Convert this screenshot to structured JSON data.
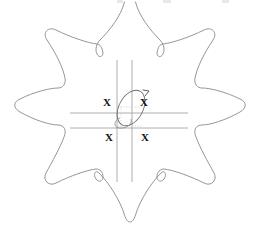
{
  "figure": {
    "background_color": "#ffffff",
    "outline_color": "#8a8a8a",
    "guide_line_color": "#9a9a9a",
    "marker_color": "#111111",
    "dotted_color": "#cccccc",
    "width": 253,
    "height": 235
  },
  "markers": {
    "label": "X",
    "positions": [
      {
        "name": "x-marker-top-left",
        "left": 103,
        "top": 97
      },
      {
        "name": "x-marker-top-right",
        "left": 140,
        "top": 97
      },
      {
        "name": "x-marker-bottom-left",
        "left": 105,
        "top": 132
      },
      {
        "name": "x-marker-bottom-right",
        "left": 141,
        "top": 132
      }
    ]
  },
  "guides": {
    "vertical_lines_x": [
      117,
      132
    ],
    "horizontal_lines_y": [
      113,
      128
    ],
    "vertical_span": [
      60,
      182
    ],
    "horizontal_span": [
      70,
      188
    ]
  },
  "center_shape": {
    "name": "tilted-ellipse",
    "cx": 131,
    "cy": 108,
    "rx": 12,
    "ry": 19,
    "rotation_deg": 28,
    "arrow": {
      "x": 148,
      "y": 92
    }
  },
  "petals": [
    {
      "name": "petal-top",
      "direction": "up"
    },
    {
      "name": "petal-upper-left",
      "direction": "upper-left"
    },
    {
      "name": "petal-upper-right",
      "direction": "upper-right"
    },
    {
      "name": "petal-left",
      "direction": "left"
    },
    {
      "name": "petal-right",
      "direction": "right"
    },
    {
      "name": "petal-lower-left",
      "direction": "lower-left"
    },
    {
      "name": "petal-lower-right",
      "direction": "lower-right"
    },
    {
      "name": "petal-bottom",
      "direction": "down"
    }
  ],
  "top_artifacts": [
    {
      "left": 117,
      "width": 6
    },
    {
      "left": 163,
      "width": 8
    },
    {
      "left": 222,
      "width": 7
    }
  ]
}
